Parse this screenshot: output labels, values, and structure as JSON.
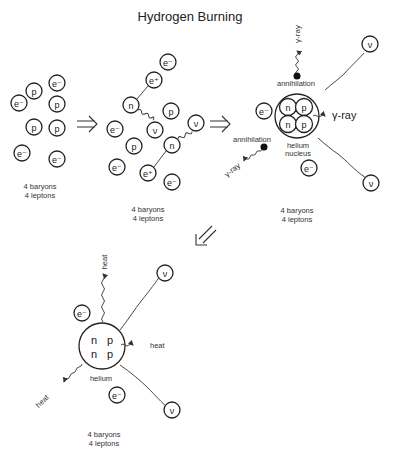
{
  "title": "Hydrogen Burning",
  "labels": {
    "proton": "p",
    "neutron": "n",
    "electron": "e⁻",
    "positron": "e⁺",
    "neutrino": "ν",
    "gamma_ray": "γ-ray",
    "annihilation": "annihilation",
    "helium_nucleus_line1": "helium",
    "helium_nucleus_line2": "nucleus",
    "helium": "helium",
    "heat": "heat"
  },
  "stages": [
    {
      "id": "stage-1",
      "count_line1": "4 baryons",
      "count_line2": "4 leptons"
    },
    {
      "id": "stage-2",
      "count_line1": "4 baryons",
      "count_line2": "4 leptons"
    },
    {
      "id": "stage-3",
      "count_line1": "4 baryons",
      "count_line2": "4 leptons"
    },
    {
      "id": "stage-4",
      "count_line1": "4 baryons",
      "count_line2": "4 leptons"
    }
  ],
  "arrows": {
    "right": "⇒",
    "down_left": "⇙"
  }
}
